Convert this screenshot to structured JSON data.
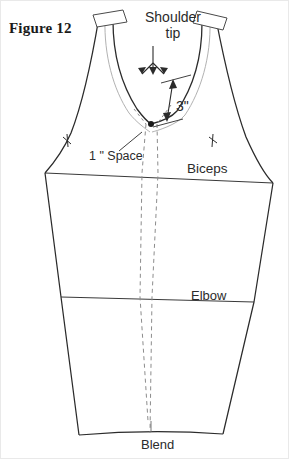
{
  "figure": {
    "caption": "Figure 12"
  },
  "annotations": {
    "shoulder_tip_line1": "Shoulder",
    "shoulder_tip_line2": "tip",
    "three_inch": "3\"",
    "one_inch_space": "1 \" Space",
    "biceps": "Biceps",
    "elbow": "Elbow",
    "blend": "Blend"
  },
  "colors": {
    "outline": "#2b2b2b",
    "inner_guide": "#9a9a9a",
    "dashed_guide": "#8c8c8c",
    "text": "#2b2b2b",
    "caption": "#1a1a1a",
    "background": "#ffffff",
    "border": "#e9e9e9"
  },
  "geometry": {
    "canvas": {
      "width": 289,
      "height": 459
    },
    "biceps_line": {
      "x1": 44,
      "y1": 172,
      "x2": 272,
      "y2": 182
    },
    "elbow_line": {
      "x1": 60,
      "y1": 296,
      "x2": 253,
      "y2": 301
    },
    "hem_line": {
      "x1": 78,
      "y1": 434,
      "x2": 222,
      "y2": 433
    },
    "center_point": {
      "x": 150,
      "y": 123
    },
    "shoulder_cap_left": {
      "x": 94,
      "y": 10
    },
    "shoulder_cap_right": {
      "x": 208,
      "y": 12
    }
  }
}
